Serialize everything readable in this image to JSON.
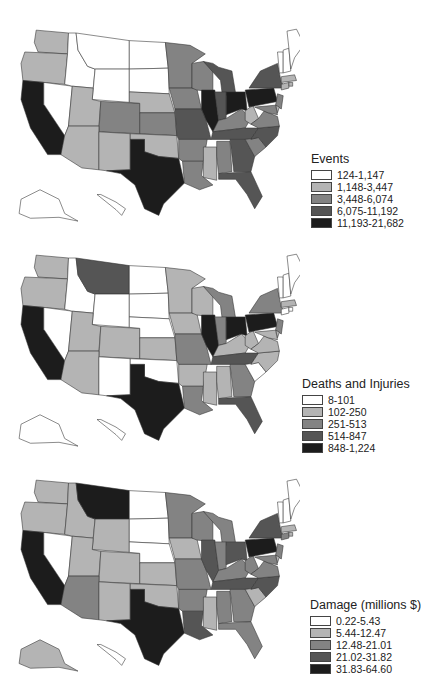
{
  "chart_data": [
    {
      "type": "choropleth",
      "title": "Events",
      "legend": [
        {
          "label": "124-1,147",
          "color": "#ffffff"
        },
        {
          "label": "1,148-3,447",
          "color": "#b4b4b4"
        },
        {
          "label": "3,448-6,074",
          "color": "#838383"
        },
        {
          "label": "6,075-11,192",
          "color": "#555555"
        },
        {
          "label": "11,193-21,682",
          "color": "#1c1c1c"
        }
      ],
      "states": {
        "WA": 1,
        "OR": 1,
        "CA": 4,
        "NV": 0,
        "ID": 0,
        "MT": 0,
        "WY": 0,
        "UT": 1,
        "AZ": 1,
        "CO": 2,
        "NM": 1,
        "ND": 0,
        "SD": 0,
        "NE": 1,
        "KS": 2,
        "OK": 1,
        "TX": 4,
        "MN": 2,
        "IA": 2,
        "MO": 3,
        "AR": 2,
        "LA": 2,
        "WI": 2,
        "IL": 4,
        "MS": 1,
        "MI": 3,
        "IN": 3,
        "KY": 2,
        "TN": 3,
        "AL": 2,
        "OH": 4,
        "WV": 1,
        "GA": 3,
        "FL": 3,
        "SC": 2,
        "NC": 3,
        "VA": 2,
        "PA": 4,
        "NY": 3,
        "ME": 0,
        "NH": 0,
        "VT": 0,
        "MA": 1,
        "CT": 1,
        "RI": 1,
        "NJ": 2,
        "DE": 1,
        "MD": 2,
        "AK": 0,
        "HI": 0
      }
    },
    {
      "type": "choropleth",
      "title": "Deaths and Injuries",
      "legend": [
        {
          "label": "8-101",
          "color": "#ffffff"
        },
        {
          "label": "102-250",
          "color": "#b4b4b4"
        },
        {
          "label": "251-513",
          "color": "#838383"
        },
        {
          "label": "514-847",
          "color": "#555555"
        },
        {
          "label": "848-1,224",
          "color": "#1c1c1c"
        }
      ],
      "states": {
        "WA": 1,
        "OR": 1,
        "CA": 4,
        "NV": 0,
        "ID": 0,
        "MT": 3,
        "WY": 0,
        "UT": 1,
        "AZ": 1,
        "CO": 1,
        "NM": 0,
        "ND": 0,
        "SD": 0,
        "NE": 0,
        "KS": 1,
        "OK": 0,
        "TX": 4,
        "MN": 1,
        "IA": 1,
        "MO": 2,
        "AR": 1,
        "LA": 2,
        "WI": 1,
        "IL": 4,
        "MS": 1,
        "MI": 2,
        "IN": 2,
        "KY": 1,
        "TN": 3,
        "AL": 1,
        "OH": 4,
        "WV": 1,
        "GA": 2,
        "FL": 3,
        "SC": 0,
        "NC": 1,
        "VA": 1,
        "PA": 4,
        "NY": 2,
        "ME": 0,
        "NH": 0,
        "VT": 0,
        "MA": 1,
        "CT": 0,
        "RI": 0,
        "NJ": 2,
        "DE": 1,
        "MD": 1,
        "AK": 0,
        "HI": 0
      }
    },
    {
      "type": "choropleth",
      "title": "Damage (millions $)",
      "legend": [
        {
          "label": "0.22-5.43",
          "color": "#ffffff"
        },
        {
          "label": "5.44-12.47",
          "color": "#b4b4b4"
        },
        {
          "label": "12.48-21.01",
          "color": "#838383"
        },
        {
          "label": "21.02-31.82",
          "color": "#555555"
        },
        {
          "label": "31.83-64.60",
          "color": "#1c1c1c"
        }
      ],
      "states": {
        "WA": 1,
        "OR": 1,
        "CA": 4,
        "NV": 0,
        "ID": 1,
        "MT": 4,
        "WY": 1,
        "UT": 1,
        "AZ": 2,
        "CO": 1,
        "NM": 1,
        "ND": 0,
        "SD": 0,
        "NE": 0,
        "KS": 1,
        "OK": 1,
        "TX": 4,
        "MN": 2,
        "IA": 1,
        "MO": 2,
        "AR": 2,
        "LA": 3,
        "WI": 2,
        "IL": 3,
        "MS": 1,
        "MI": 2,
        "IN": 2,
        "KY": 2,
        "TN": 3,
        "AL": 2,
        "OH": 3,
        "WV": 2,
        "GA": 2,
        "FL": 2,
        "SC": 1,
        "NC": 3,
        "VA": 2,
        "PA": 4,
        "NY": 3,
        "ME": 0,
        "NH": 0,
        "VT": 0,
        "MA": 1,
        "CT": 2,
        "RI": 1,
        "NJ": 2,
        "DE": 1,
        "MD": 2,
        "AK": 1,
        "HI": 0
      }
    }
  ]
}
